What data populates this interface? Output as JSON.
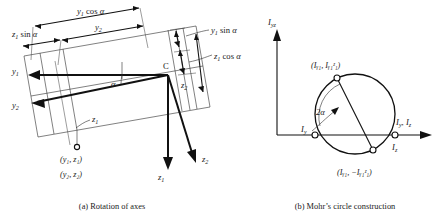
{
  "figure": {
    "panels": [
      {
        "id": "rotation-of-axes",
        "caption": "(a) Rotation of axes",
        "axis_labels": {
          "y1": "y",
          "y1_sub": "1",
          "y2": "y",
          "y2_sub": "2",
          "z1": "z",
          "z1_sub": "1",
          "z2": "z",
          "z2_sub": "2"
        },
        "origin_label": "C",
        "angle_label": "α",
        "dimensions": [
          {
            "id": "y1cos",
            "base": "y",
            "sub": "1",
            "func": " cos ",
            "arg": "α"
          },
          {
            "id": "z1sin",
            "base": "z",
            "sub": "1",
            "func": " sin ",
            "arg": "α"
          },
          {
            "id": "y2",
            "base": "y",
            "sub": "2",
            "func": "",
            "arg": ""
          },
          {
            "id": "y1sin",
            "base": "y",
            "sub": "1",
            "func": " sin ",
            "arg": "α"
          },
          {
            "id": "z1cos",
            "base": "z",
            "sub": "1",
            "func": " cos ",
            "arg": "α"
          },
          {
            "id": "z2",
            "base": "z",
            "sub": "2",
            "func": "",
            "arg": ""
          },
          {
            "id": "z1dim",
            "base": "z",
            "sub": "1",
            "func": "",
            "arg": ""
          }
        ],
        "point_labels": [
          {
            "id": "pt-yz-1",
            "text": "(y₁, z₁)"
          },
          {
            "id": "pt-yz-2",
            "text": "(y₂, z₂)"
          }
        ]
      },
      {
        "id": "mohrs-circle",
        "caption": "(b) Mohr’s circle construction",
        "vertical_axis": {
          "base": "I",
          "sub": "yz"
        },
        "horizontal_axis": {
          "base_1": "I",
          "sub_1": "y",
          "sep": ", ",
          "base_2": "I",
          "sub_2": "z"
        },
        "intercepts": [
          {
            "id": "iy",
            "base": "I",
            "sub": "y"
          },
          {
            "id": "iz",
            "base": "I",
            "sub": "z"
          }
        ],
        "angle_label": "2α",
        "points": [
          {
            "id": "top-point",
            "text": "(Iᵧ₁, Iᵧ₁ᶻ₁)"
          },
          {
            "id": "bottom-point",
            "text": "(Iᵧ₁, −Iᵧ₁ᶻ₁)"
          }
        ]
      }
    ]
  },
  "colors": {
    "ink": "#1a1a1a",
    "heavy_stroke": "#111111",
    "thin_stroke": "#2b2b2b",
    "background": "#ffffff"
  }
}
